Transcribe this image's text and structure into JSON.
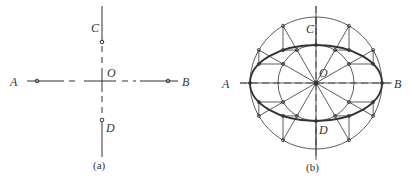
{
  "figure_a": {
    "caption": "(a)",
    "labels": {
      "A": "A",
      "B": "B",
      "C": "C",
      "D": "D",
      "O": "O"
    }
  },
  "figure_b": {
    "caption": "(b)",
    "labels": {
      "A": "A",
      "B": "B",
      "C": "C",
      "D": "D",
      "O": "O"
    }
  },
  "colors": {
    "line": "#333333",
    "background": "#ffffff"
  }
}
